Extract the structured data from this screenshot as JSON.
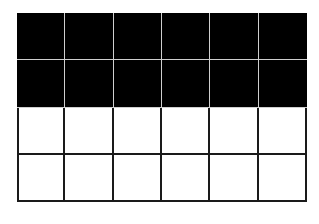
{
  "figure": {
    "type": "fraction-grid",
    "rows": 4,
    "columns": 6,
    "filled_rows": 2,
    "total_cells": 24,
    "filled_cells": 12,
    "colors": {
      "filled": "#000000",
      "empty": "#ffffff",
      "filled_divider": "#cfcfcf",
      "empty_divider": "#1a1a1a"
    }
  }
}
